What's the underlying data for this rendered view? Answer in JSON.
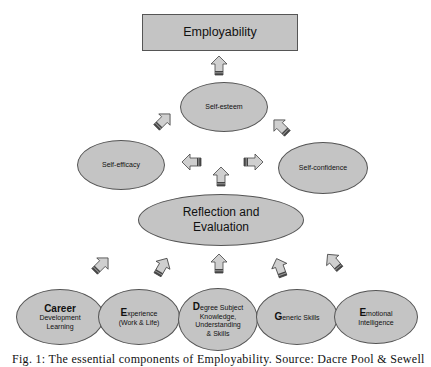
{
  "diagram": {
    "top": {
      "label": "Employability"
    },
    "self_esteem": {
      "label": "Self-esteem"
    },
    "self_efficacy": {
      "label": "Self-efficacy"
    },
    "self_confidence": {
      "label": "Self-confidence"
    },
    "reflection": {
      "line1": "Reflection and",
      "line2": "Evaluation"
    },
    "components": [
      {
        "initial": "Career",
        "rest_line1": "",
        "line2": "Development",
        "line3": "Learning"
      },
      {
        "initial": "E",
        "rest_line1": "xperience",
        "line2": "(Work & Life)",
        "line3": ""
      },
      {
        "initial": "D",
        "rest_line1": "egree Subject",
        "line2": "Knowledge,",
        "line3": "Understanding",
        "line4": "& Skills"
      },
      {
        "initial": "G",
        "rest_line1": "eneric Skills",
        "line2": "",
        "line3": ""
      },
      {
        "initial": "E",
        "rest_line1": "motional",
        "line2": "Intelligence",
        "line3": ""
      }
    ],
    "arrows": [
      {
        "from": "self_esteem",
        "to": "employability",
        "direction": "up"
      },
      {
        "from": "self_efficacy",
        "to": "self_esteem",
        "direction": "up-right"
      },
      {
        "from": "self_confidence",
        "to": "self_esteem",
        "direction": "up-left"
      },
      {
        "from": "reflection",
        "to": "self_efficacy",
        "direction": "left"
      },
      {
        "from": "reflection",
        "to": "self_confidence",
        "direction": "right"
      },
      {
        "from": "reflection",
        "to": "self_esteem",
        "direction": "up"
      },
      {
        "from": "career_development_learning",
        "to": "reflection",
        "direction": "up-right"
      },
      {
        "from": "experience",
        "to": "reflection",
        "direction": "up-right"
      },
      {
        "from": "degree_subject",
        "to": "reflection",
        "direction": "up"
      },
      {
        "from": "generic_skills",
        "to": "reflection",
        "direction": "up-left"
      },
      {
        "from": "emotional_intelligence",
        "to": "reflection",
        "direction": "up-left"
      }
    ],
    "colors": {
      "fill": "#c4c4c4",
      "stroke": "#555555",
      "arrow_fill": "#cfcfcf",
      "arrow_band": "#444444"
    }
  },
  "caption": "Fig. 1: The essential components of Employability. Source: Dacre Pool & Sewell"
}
